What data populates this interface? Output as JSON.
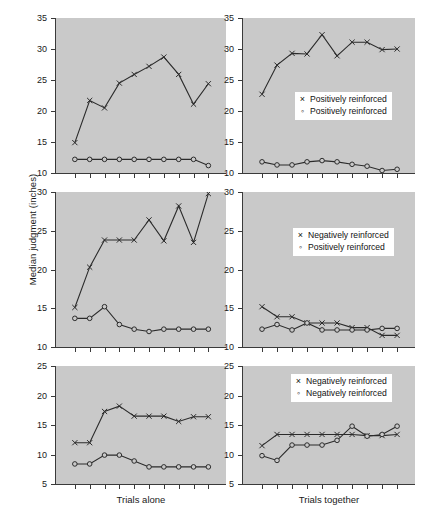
{
  "chart_data": {
    "type": "line",
    "title": "",
    "ylabel": "Median judgment (inches)",
    "shared_x_points": 10,
    "columns": [
      {
        "key": "alone",
        "xlabel": "Trials alone"
      },
      {
        "key": "together",
        "xlabel": "Trials together"
      }
    ],
    "panels": [
      {
        "id": "row1-left",
        "row": 1,
        "col": 1,
        "ylim": [
          10,
          35
        ],
        "yticks": [
          10,
          15,
          20,
          25,
          30,
          35
        ],
        "xlabel": "Trials alone",
        "legend": null,
        "series": [
          {
            "name": "Positively reinforced",
            "marker": "x",
            "values": [
              14.9,
              21.7,
              20.5,
              24.5,
              25.9,
              27.2,
              28.7,
              25.9,
              21.1,
              24.4
            ]
          },
          {
            "name": "Positively reinforced",
            "marker": "o",
            "values": [
              12.2,
              12.2,
              12.2,
              12.2,
              12.2,
              12.2,
              12.2,
              12.2,
              12.2,
              11.2
            ]
          }
        ]
      },
      {
        "id": "row1-right",
        "row": 1,
        "col": 2,
        "ylim": [
          10,
          35
        ],
        "yticks": [
          10,
          15,
          20,
          25,
          30,
          35
        ],
        "xlabel": "Trials together",
        "legend": {
          "entries": [
            {
              "marker": "x",
              "label": "Positively reinforced"
            },
            {
              "marker": "o",
              "label": "Positively reinforced"
            }
          ]
        },
        "series": [
          {
            "name": "Positively reinforced",
            "marker": "x",
            "values": [
              22.7,
              27.4,
              29.3,
              29.2,
              32.3,
              28.9,
              31.1,
              31.1,
              29.9,
              30.0
            ]
          },
          {
            "name": "Positively reinforced",
            "marker": "o",
            "values": [
              11.8,
              11.3,
              11.3,
              11.8,
              12.0,
              11.8,
              11.4,
              11.1,
              10.4,
              10.6
            ]
          }
        ]
      },
      {
        "id": "row2-left",
        "row": 2,
        "col": 1,
        "ylim": [
          10,
          30
        ],
        "yticks": [
          10,
          15,
          20,
          25,
          30
        ],
        "xlabel": "Trials alone",
        "legend": null,
        "series": [
          {
            "name": "Negatively reinforced",
            "marker": "x",
            "values": [
              15.1,
              20.3,
              23.8,
              23.8,
              23.8,
              26.4,
              23.7,
              28.2,
              23.5,
              29.8
            ]
          },
          {
            "name": "Positively reinforced",
            "marker": "o",
            "values": [
              13.7,
              13.7,
              15.2,
              12.9,
              12.3,
              12.0,
              12.3,
              12.3,
              12.3,
              12.3
            ]
          }
        ]
      },
      {
        "id": "row2-right",
        "row": 2,
        "col": 2,
        "ylim": [
          10,
          30
        ],
        "yticks": [
          10,
          15,
          20,
          25,
          30
        ],
        "xlabel": "Trials together",
        "legend": {
          "entries": [
            {
              "marker": "x",
              "label": "Negatively reinforced"
            },
            {
              "marker": "o",
              "label": "Positively reinforced"
            }
          ]
        },
        "series": [
          {
            "name": "Negatively reinforced",
            "marker": "x",
            "values": [
              15.2,
              13.9,
              13.9,
              13.1,
              13.1,
              13.1,
              12.5,
              12.5,
              11.5,
              11.5
            ]
          },
          {
            "name": "Positively reinforced",
            "marker": "o",
            "values": [
              12.3,
              12.9,
              12.2,
              13.1,
              12.2,
              12.2,
              12.2,
              12.2,
              12.4,
              12.4
            ]
          }
        ]
      },
      {
        "id": "row3-left",
        "row": 3,
        "col": 1,
        "ylim": [
          5,
          25
        ],
        "yticks": [
          5,
          10,
          15,
          20,
          25
        ],
        "xlabel": "Trials alone",
        "legend": null,
        "series": [
          {
            "name": "Negatively reinforced",
            "marker": "x",
            "values": [
              12.0,
              12.0,
              17.3,
              18.2,
              16.5,
              16.5,
              16.5,
              15.6,
              16.4,
              16.4
            ]
          },
          {
            "name": "Negatively reinforced",
            "marker": "o",
            "values": [
              8.4,
              8.4,
              9.9,
              9.9,
              8.9,
              7.9,
              7.9,
              7.9,
              7.9,
              7.9
            ]
          }
        ]
      },
      {
        "id": "row3-right",
        "row": 3,
        "col": 2,
        "ylim": [
          5,
          25
        ],
        "yticks": [
          5,
          10,
          15,
          20,
          25
        ],
        "xlabel": "Trials together",
        "legend": {
          "entries": [
            {
              "marker": "x",
              "label": "Negatively reinforced"
            },
            {
              "marker": "o",
              "label": "Negatively reinforced"
            }
          ]
        },
        "series": [
          {
            "name": "Negatively reinforced",
            "marker": "x",
            "values": [
              11.5,
              13.4,
              13.4,
              13.4,
              13.4,
              13.4,
              13.4,
              13.2,
              13.2,
              13.4
            ]
          },
          {
            "name": "Negatively reinforced",
            "marker": "o",
            "values": [
              9.8,
              9.0,
              11.6,
              11.6,
              11.6,
              12.4,
              14.8,
              13.1,
              13.4,
              14.8
            ]
          }
        ]
      }
    ]
  },
  "colors": {
    "panel_background": "#c9c9c9",
    "axis": "#3a3a3a",
    "line": "#2b2b2b",
    "text": "#1a1a1a",
    "legend_background": "#ffffff"
  }
}
